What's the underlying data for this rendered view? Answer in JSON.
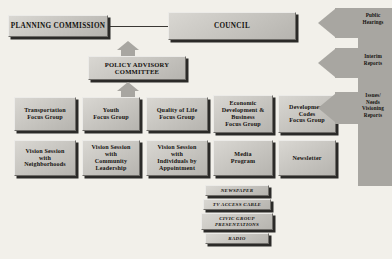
{
  "diagram": {
    "background_color": "#f2f0ea",
    "box_fill_color": "#c9c7c2",
    "arrow_color": "#a8a6a1",
    "text_color": "#14120f"
  },
  "top_tier": {
    "planning_commission": "PLANNING COMMISSION",
    "council": "COUNCIL",
    "policy_advisory_committee": "POLICY ADVISORY COMMITTEE"
  },
  "focus_groups": [
    {
      "label": "Transportation\nFocus Group",
      "line1": "Transportation",
      "line2": "Focus Group"
    },
    {
      "label": "Youth\nFocus Group",
      "line1": "Youth",
      "line2": "Focus Group"
    },
    {
      "label": "Quality of Life\nFocus Group",
      "line1": "Quality of Life",
      "line2": "Focus Group"
    },
    {
      "label": "Economic Development & Business Focus Group",
      "line1": "Economic",
      "line2": "Development &",
      "line3": "Business",
      "line4": "Focus Group"
    },
    {
      "label": "Development Codes Focus Group",
      "line1": "Development",
      "line2": "Codes",
      "line3": "Focus Group"
    }
  ],
  "outreach": [
    {
      "label": "Vision Session with Neighborhoods",
      "line1": "Vision Session",
      "line2": "with",
      "line3": "Neighborhoods"
    },
    {
      "label": "Vision Session with Community Leadership",
      "line1": "Vision Session",
      "line2": "with",
      "line3": "Community",
      "line4": "Leadership"
    },
    {
      "label": "Vision Session with Individuals by Appointment",
      "line1": "Vision Session",
      "line2": "with",
      "line3": "Individuals by",
      "line4": "Appointment"
    },
    {
      "label": "Media Program",
      "line1": "Media",
      "line2": "Program"
    },
    {
      "label": "Newsletter",
      "line1": "Newsletter"
    }
  ],
  "media_channels": [
    {
      "label": "NEWSPAPER"
    },
    {
      "label": "TV ACCESS CABLE"
    },
    {
      "label": "CIVIC GROUP PRESENTATIONS",
      "line1": "CIVIC GROUP",
      "line2": "PRESENTATIONS"
    },
    {
      "label": "RADIO"
    }
  ],
  "feedback_arrows": [
    {
      "label": "Public Hearings",
      "line1": "Public",
      "line2": "Hearings"
    },
    {
      "label": "Interim Reports",
      "line1": "Interim",
      "line2": "Reports"
    },
    {
      "label": "Issues/Needs Visioning Reports",
      "line1": "Issues/",
      "line2": "Needs",
      "line3": "Visioning",
      "line4": "Reports"
    }
  ]
}
